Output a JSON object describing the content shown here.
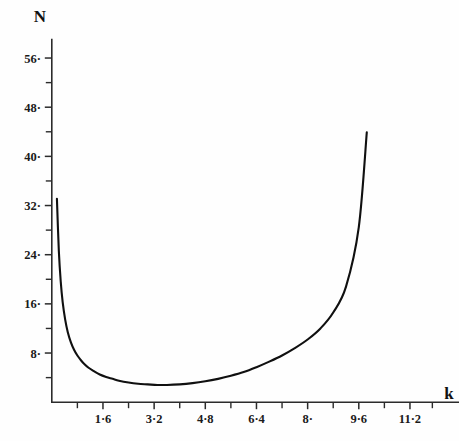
{
  "chart_data": {
    "type": "line",
    "title": "",
    "subtitle": "",
    "xlabel": "k",
    "ylabel": "N",
    "grid": false,
    "legend": false,
    "xlim": [
      0.0,
      11.9
    ],
    "ylim": [
      0.0,
      59.0
    ],
    "x_ticks_major": [
      1.6,
      3.2,
      4.8,
      6.4,
      8.0,
      9.6,
      11.2
    ],
    "x_ticklabels": [
      "1·6",
      "3·2",
      "4·8",
      "6·4",
      "8·",
      "9·6",
      "11·2"
    ],
    "x_ticks_minor": [
      0.8,
      2.4,
      4.0,
      5.6,
      7.2,
      8.8,
      10.4,
      11.9
    ],
    "y_ticks_major": [
      8,
      16,
      24,
      32,
      40,
      48,
      56
    ],
    "y_ticklabels": [
      "8·",
      "16·",
      "24·",
      "32·",
      "40·",
      "48·",
      "56·"
    ],
    "y_ticks_minor": [
      4,
      12,
      20,
      28,
      36,
      44,
      52
    ],
    "series": [
      {
        "name": "N(k)",
        "color": "#101010",
        "x": [
          0.16,
          0.22,
          0.28,
          0.34,
          0.42,
          0.5,
          0.6,
          0.7,
          0.8,
          0.9,
          1.0,
          1.15,
          1.3,
          1.5,
          1.7,
          1.9,
          2.1,
          2.4,
          2.7,
          3.0,
          3.3,
          3.6,
          4.0,
          4.4,
          4.8,
          5.2,
          5.6,
          6.0,
          6.4,
          6.8,
          7.2,
          7.6,
          8.0,
          8.4,
          8.8,
          9.2,
          9.6,
          9.85
        ],
        "y": [
          33.1,
          24.6,
          19.6,
          16.3,
          13.4,
          11.4,
          9.7,
          8.5,
          7.6,
          6.9,
          6.3,
          5.6,
          5.1,
          4.5,
          4.1,
          3.8,
          3.5,
          3.2,
          3.0,
          2.9,
          2.8,
          2.8,
          2.9,
          3.1,
          3.4,
          3.8,
          4.3,
          4.9,
          5.7,
          6.6,
          7.6,
          8.8,
          10.2,
          12.0,
          14.6,
          18.8,
          28.5,
          43.9
        ]
      }
    ],
    "annotations": []
  },
  "axes": {
    "y_axis_title": "N",
    "x_axis_title": "k"
  },
  "colors": {
    "background": "#fefefe",
    "axis": "#2b2b2b",
    "curve": "#101010",
    "text": "#1a1a1a"
  }
}
